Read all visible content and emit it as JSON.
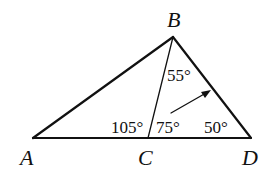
{
  "diagram": {
    "points": {
      "A": {
        "label": "A"
      },
      "B": {
        "label": "B"
      },
      "C": {
        "label": "C"
      },
      "D": {
        "label": "D"
      }
    },
    "angles": {
      "CBD": "55°",
      "BCA": "105°",
      "BCD": "75°",
      "BDC": "50°"
    },
    "colors": {
      "stroke": "#111111",
      "background": "#ffffff"
    }
  }
}
